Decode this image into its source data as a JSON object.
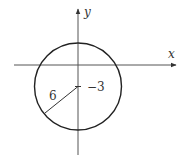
{
  "diagram": {
    "type": "circle-on-coordinate-axes",
    "axes": {
      "x_label": "x",
      "y_label": "y"
    },
    "circle": {
      "center_label": "−3",
      "radius_label": "6",
      "center": [
        0,
        -3
      ],
      "radius": 6
    },
    "colors": {
      "stroke": "#222222",
      "axis": "#555555",
      "text": "#333333"
    }
  }
}
